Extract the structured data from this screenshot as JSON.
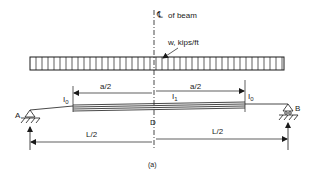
{
  "diagram": {
    "type": "simply-supported beam with uniform load and stepped moment of inertia",
    "centerline_label": "of beam",
    "centerline_symbol": "℄",
    "load_label": "w, kips/ft",
    "dimension_a_left": "a/2",
    "dimension_a_right": "a/2",
    "inertia_left": "I",
    "inertia_left_sub": "0",
    "inertia_middle": "I",
    "inertia_middle_sub": "1",
    "inertia_right": "I",
    "inertia_right_sub": "0",
    "support_left": "A",
    "support_right": "B",
    "midpoint": "D",
    "dimension_L_left": "L/2",
    "dimension_L_right": "L/2",
    "caption": "(a)"
  }
}
